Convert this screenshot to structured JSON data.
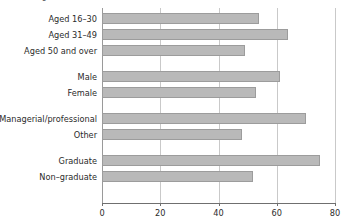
{
  "chart": {
    "clipped_title": "Percentage"
  },
  "chart_data": {
    "type": "bar",
    "orientation": "horizontal",
    "title": "",
    "subtitle": "",
    "xlabel": "",
    "ylabel": "",
    "xlim": [
      0,
      80
    ],
    "grid": true,
    "legend": false,
    "xticks": [
      0,
      20,
      40,
      60,
      80
    ],
    "xtick_labels": [
      "0",
      "20",
      "40",
      "60",
      "80"
    ],
    "bar_color": "#b9b9b9",
    "bar_edge_color": "#9c9c9c",
    "groups": [
      {
        "name": "Age",
        "categories": [
          "Aged 16–30",
          "Aged 31–49",
          "Aged 50 and over"
        ],
        "values": [
          54,
          64,
          49
        ]
      },
      {
        "name": "Sex",
        "categories": [
          "Male",
          "Female"
        ],
        "values": [
          61,
          53
        ]
      },
      {
        "name": "Occupation",
        "categories": [
          "Managerial/professional",
          "Other"
        ],
        "values": [
          70,
          48
        ]
      },
      {
        "name": "Education",
        "categories": [
          "Graduate",
          "Non–graduate"
        ],
        "values": [
          75,
          52
        ]
      }
    ],
    "categories": [
      "Aged 16–30",
      "Aged 31–49",
      "Aged 50 and over",
      "Male",
      "Female",
      "Managerial/professional",
      "Other",
      "Graduate",
      "Non–graduate"
    ],
    "values": [
      54,
      64,
      49,
      61,
      53,
      70,
      48,
      75,
      52
    ]
  }
}
